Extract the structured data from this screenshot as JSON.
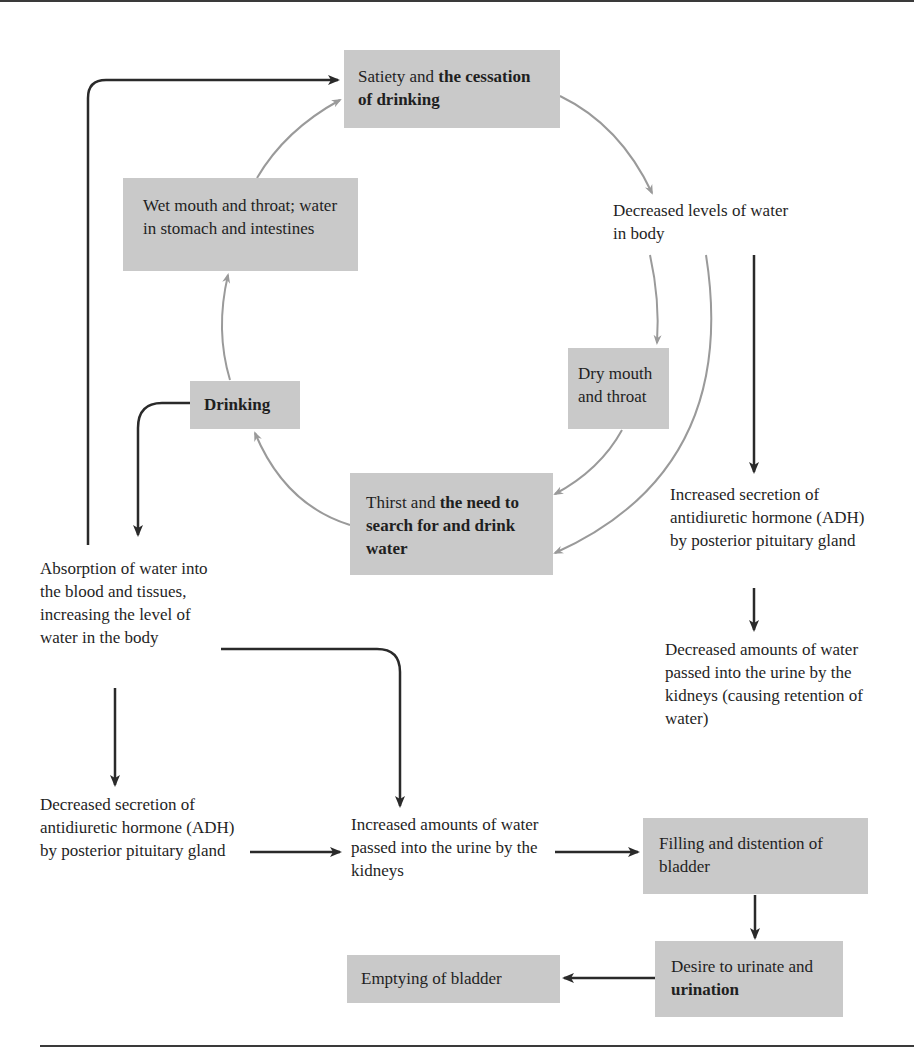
{
  "diagram": {
    "boxes": {
      "satiety": {
        "plain": "Satiety and ",
        "bold": "the cessation of drinking"
      },
      "wet_mouth": {
        "plain": "Wet mouth and throat; water in stomach and intestines"
      },
      "drinking": {
        "bold": "Drinking"
      },
      "dry_mouth": {
        "plain": "Dry mouth and throat"
      },
      "thirst": {
        "plain": "Thirst and ",
        "bold": "the need to search for and drink water"
      },
      "filling": {
        "plain": "Filling and distention of bladder"
      },
      "desire": {
        "plain": "Desire to urinate and ",
        "bold": "urination"
      },
      "emptying": {
        "plain": "Emptying of bladder"
      }
    },
    "labels": {
      "decreased_levels": "Decreased levels of water in body",
      "increased_adh": "Increased secretion of antidiuretic hormone (ADH) by posterior pituitary gland",
      "decreased_urine": "Decreased amounts of water passed into the urine by the kidneys (causing retention of water)",
      "absorption": "Absorption of water into the blood and tissues, increasing the level of water in the body",
      "decreased_adh": "Decreased secretion of antidiuretic hormone (ADH) by posterior pituitary gland",
      "increased_urine": "Increased amounts of water passed into the urine by the kidneys"
    },
    "colors": {
      "box_fill": "#c9c9c9",
      "cycle_arrow": "#9a9a9a",
      "flow_arrow": "#2a2a2a",
      "text": "#1f1f1f"
    },
    "edges": [
      {
        "from": "satiety",
        "to": "decreased_levels",
        "style": "gray"
      },
      {
        "from": "decreased_levels",
        "to": "dry_mouth",
        "style": "gray"
      },
      {
        "from": "decreased_levels",
        "to": "thirst",
        "style": "gray"
      },
      {
        "from": "dry_mouth",
        "to": "thirst",
        "style": "gray"
      },
      {
        "from": "thirst",
        "to": "drinking",
        "style": "gray"
      },
      {
        "from": "drinking",
        "to": "wet_mouth",
        "style": "gray"
      },
      {
        "from": "wet_mouth",
        "to": "satiety",
        "style": "gray"
      },
      {
        "from": "decreased_levels",
        "to": "increased_adh",
        "style": "black"
      },
      {
        "from": "increased_adh",
        "to": "decreased_urine",
        "style": "black"
      },
      {
        "from": "drinking",
        "to": "absorption",
        "style": "black"
      },
      {
        "from": "absorption",
        "to": "satiety",
        "style": "black"
      },
      {
        "from": "absorption",
        "to": "decreased_adh",
        "style": "black"
      },
      {
        "from": "absorption",
        "to": "increased_urine",
        "style": "black"
      },
      {
        "from": "decreased_adh",
        "to": "increased_urine",
        "style": "black"
      },
      {
        "from": "increased_urine",
        "to": "filling",
        "style": "black"
      },
      {
        "from": "filling",
        "to": "desire",
        "style": "black"
      },
      {
        "from": "desire",
        "to": "emptying",
        "style": "black"
      }
    ]
  }
}
